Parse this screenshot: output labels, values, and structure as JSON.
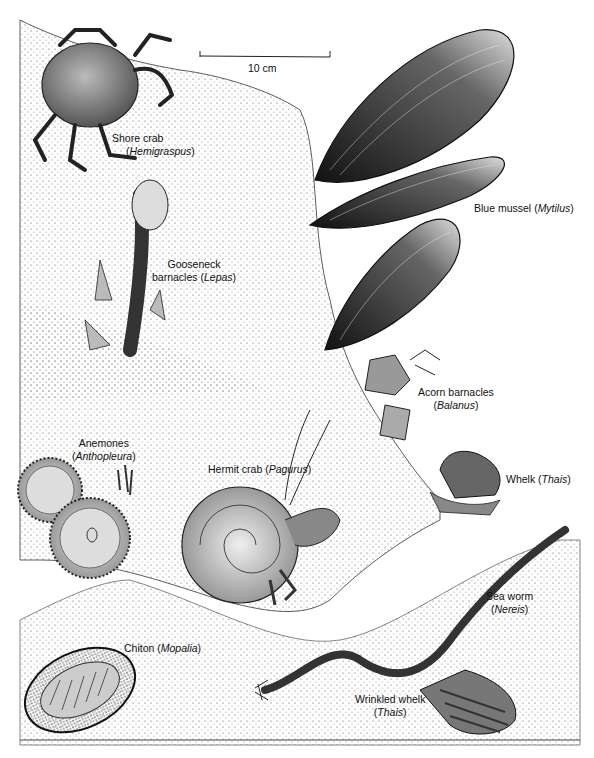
{
  "figure": {
    "scale_bar": {
      "label": "10 cm"
    },
    "organisms": [
      {
        "id": "shore-crab",
        "common": "Shore crab",
        "genus": "Hemigraspus"
      },
      {
        "id": "gooseneck-barnacles",
        "common": "Gooseneck barnacles",
        "common_line1": "Gooseneck",
        "common_line2": "barnacles",
        "genus": "Lepas"
      },
      {
        "id": "blue-mussel",
        "common": "Blue mussel",
        "genus": "Mytilus"
      },
      {
        "id": "acorn-barnacles",
        "common": "Acorn barnacles",
        "genus": "Balanus"
      },
      {
        "id": "anemones",
        "common": "Anemones",
        "genus": "Anthopleura"
      },
      {
        "id": "hermit-crab",
        "common": "Hermit crab",
        "genus": "Pagurus"
      },
      {
        "id": "whelk",
        "common": "Whelk",
        "genus": "Thais"
      },
      {
        "id": "sea-worm",
        "common": "Sea worm",
        "genus": "Nereis"
      },
      {
        "id": "chiton",
        "common": "Chiton",
        "genus": "Mopalia"
      },
      {
        "id": "wrinkled-whelk",
        "common": "Wrinkled whelk",
        "genus": "Thais"
      }
    ]
  },
  "paren": {
    "open": "(",
    "close": ")"
  }
}
